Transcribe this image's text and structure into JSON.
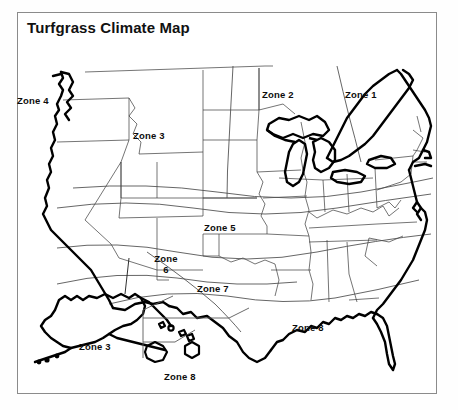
{
  "figure": {
    "title": "Turfgrass Climate Map",
    "frame_color": "#8b8b8b",
    "background_color": "#ffffff",
    "ink_color": "#000000"
  },
  "map": {
    "kind": "united-states-climate-zone-map",
    "features": [
      "contiguous-united-states-outline",
      "state-boundaries",
      "great-lakes",
      "alaska-inset",
      "hawaii-inset",
      "zone-boundary-curves"
    ]
  },
  "zone_labels": [
    {
      "id": "zone-4-pacific-northwest",
      "text": "Zone 4",
      "x": 17,
      "y": 95
    },
    {
      "id": "zone-3-northern-rockies",
      "text": "Zone 3",
      "x": 133,
      "y": 130
    },
    {
      "id": "zone-2-upper-midwest",
      "text": "Zone 2",
      "x": 262,
      "y": 89
    },
    {
      "id": "zone-1-northeast",
      "text": "Zone 1",
      "x": 345,
      "y": 89
    },
    {
      "id": "zone-5-central-plains",
      "text": "Zone 5",
      "x": 204,
      "y": 222
    },
    {
      "id": "zone-6-southwest",
      "text": "Zone 6",
      "x": 146,
      "y": 253
    },
    {
      "id": "zone-7-south-central",
      "text": "Zone 7",
      "x": 197,
      "y": 283
    },
    {
      "id": "zone-8-southeast",
      "text": "Zone 8",
      "x": 292,
      "y": 322
    },
    {
      "id": "zone-3-alaska",
      "text": "Zone 3",
      "x": 79,
      "y": 341
    },
    {
      "id": "zone-8-hawaii",
      "text": "Zone 8",
      "x": 164,
      "y": 371
    }
  ],
  "zone_legend_note": {
    "zones_present": [
      "Zone 1",
      "Zone 2",
      "Zone 3",
      "Zone 4",
      "Zone 5",
      "Zone 6",
      "Zone 7",
      "Zone 8"
    ]
  }
}
